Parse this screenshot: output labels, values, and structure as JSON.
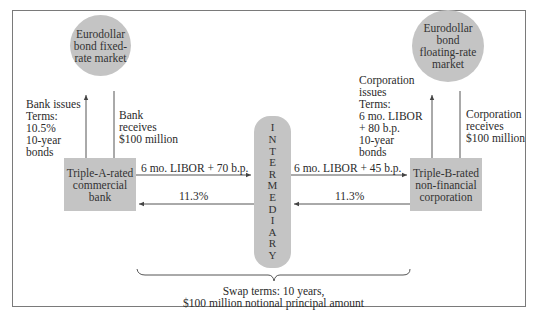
{
  "nodes": {
    "fixed_market": "Eurodollar\nbond fixed-\nrate market",
    "floating_market": "Eurodollar\nbond\nfloating-rate\nmarket",
    "bank": "Triple-A-rated\ncommercial\nbank",
    "corporation": "Triple-B-rated\nnon-financial\ncorporation",
    "intermediary_letters": [
      "I",
      "N",
      "T",
      "E",
      "R",
      "M",
      "E",
      "D",
      "I",
      "A",
      "R",
      "Y"
    ]
  },
  "labels": {
    "bank_issues": "Bank issues\nTerms:\n10.5%\n10-year\nbonds",
    "bank_receives": "Bank\nreceives\n$100 million",
    "corp_issues": "Corporation\nissues\nTerms:\n6 mo. LIBOR\n+ 80 b.p.\n10-year\nbonds",
    "corp_receives": "Corporation\nreceives\n$100 million"
  },
  "flows": {
    "bank_to_intermediary": "6 mo. LIBOR + 70 b.p.",
    "intermediary_to_bank": "11.3%",
    "intermediary_to_corp": "6 mo. LIBOR + 45 b.p.",
    "corp_to_intermediary": "11.3%"
  },
  "swap_terms": {
    "line1": "Swap terms: 10 years,",
    "line2": "$100 million notional principal amount"
  },
  "colors": {
    "node_fill": "#c4c4c4",
    "line": "#555555",
    "frame": "#7a7a7a"
  }
}
